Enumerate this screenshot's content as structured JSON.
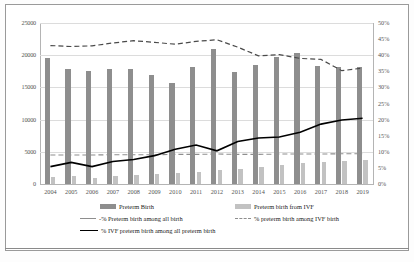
{
  "chart_data": {
    "type": "bar",
    "title": "",
    "xlabel": "",
    "ylabel": "",
    "grid": true,
    "legend_position": "bottom",
    "categories": [
      "2004",
      "2005",
      "2006",
      "2007",
      "2008",
      "2009",
      "2010",
      "2011",
      "2012",
      "2013",
      "2014",
      "2015",
      "2016",
      "2017",
      "2018",
      "2019"
    ],
    "left_axis": {
      "ylim": [
        0,
        25000
      ],
      "ticks": [
        "0",
        "5000",
        "10000",
        "15000",
        "20000",
        "25000"
      ],
      "tick_values": [
        0,
        5000,
        10000,
        15000,
        20000,
        25000
      ]
    },
    "right_axis": {
      "ylim": [
        0,
        50
      ],
      "ticks": [
        "0%",
        "5%",
        "10%",
        "15%",
        "20%",
        "25%",
        "30%",
        "35%",
        "40%",
        "45%",
        "50%"
      ],
      "tick_values": [
        0,
        5,
        10,
        15,
        20,
        25,
        30,
        35,
        40,
        45,
        50
      ]
    },
    "series": [
      {
        "name": "Preterm Birth",
        "type": "bar",
        "axis": "left",
        "color": "#8e8e8e",
        "values": [
          19500,
          17900,
          17500,
          17800,
          17800,
          17000,
          15700,
          18200,
          20900,
          17400,
          18500,
          19800,
          20300,
          18300,
          18100,
          18100
        ]
      },
      {
        "name": "Preterm birth from IVF",
        "type": "bar",
        "axis": "left",
        "color": "#c2c2c2",
        "values": [
          1050,
          1200,
          950,
          1250,
          1350,
          1500,
          1700,
          1900,
          2150,
          2300,
          2650,
          2900,
          3200,
          3400,
          3600,
          3700
        ]
      },
      {
        "name": "% Preterm birth among all birth",
        "type": "line",
        "style": "dashed",
        "axis": "right",
        "color": "#8e8e8e",
        "values": [
          9.0,
          9.0,
          9.0,
          9.1,
          9.1,
          9.1,
          9.2,
          9.2,
          9.3,
          9.2,
          9.2,
          9.3,
          9.3,
          9.3,
          9.4,
          9.4
        ]
      },
      {
        "name": "% preterm birth among IVF birth",
        "type": "line",
        "style": "dashed",
        "axis": "right",
        "color": "#4a4a4a",
        "values": [
          43.0,
          42.7,
          42.9,
          43.8,
          44.5,
          44.0,
          43.4,
          44.3,
          44.8,
          42.5,
          39.8,
          40.2,
          39.0,
          38.7,
          35.2,
          36.0
        ]
      },
      {
        "name": "% IVF preterm birth among all preterm birth",
        "type": "line",
        "style": "solid",
        "axis": "right",
        "color": "#000000",
        "values": [
          5.4,
          6.7,
          5.4,
          7.0,
          7.6,
          8.8,
          10.8,
          12.1,
          10.3,
          13.2,
          14.3,
          14.6,
          16.1,
          18.6,
          19.9,
          20.4
        ]
      }
    ]
  },
  "legend": {
    "items": [
      {
        "label": "Preterm Birth",
        "marker": "bar-dark"
      },
      {
        "label": "Preterm birth from IVF",
        "marker": "bar-light"
      },
      {
        "label": "-% Preterm birth among all birth",
        "marker": "solid-gray"
      },
      {
        "label": "% preterm birth among IVF birth",
        "marker": "dash-gray"
      },
      {
        "label": "% IVF preterm birth among all preterm birth",
        "marker": "solid-black"
      }
    ]
  }
}
